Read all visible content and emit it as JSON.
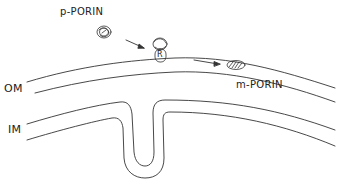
{
  "labels": {
    "p_porin": "p-PORIN",
    "m_porin": "m-PORIN",
    "om": "OM",
    "im": "IM",
    "receptor": "R"
  },
  "colors": {
    "stroke": "#333333",
    "background": "#ffffff"
  }
}
